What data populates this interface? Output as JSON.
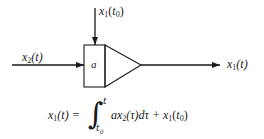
{
  "diagram": {
    "type": "integrator-block",
    "blocks": [
      {
        "id": "gain-box",
        "label": "a"
      },
      {
        "id": "integrator-triangle",
        "label": ""
      }
    ],
    "signals": {
      "input": {
        "var": "x",
        "sub": "2",
        "arg": "(t)"
      },
      "initial_condition": {
        "var": "x",
        "sub": "1",
        "arg_open": "(",
        "arg_var": "t",
        "arg_sub": "0",
        "arg_close": ")"
      },
      "output": {
        "var": "x",
        "sub": "1",
        "arg": "(t)"
      }
    },
    "equation": {
      "lhs_var": "x",
      "lhs_sub": "1",
      "lhs_arg": "(t) =",
      "integral_sign": "∫",
      "upper_limit": "t",
      "lower_limit_var": "t",
      "lower_limit_sub": "0",
      "integrand_a": "a",
      "integrand_x": "x",
      "integrand_sub": "2",
      "integrand_rest": "(τ)dτ + ",
      "ic_var": "x",
      "ic_sub": "1",
      "ic_open": "(",
      "ic_t": "t",
      "ic_t_sub": "0",
      "ic_close": ")"
    },
    "colors": {
      "stroke": "#1a1a1a",
      "background": "#ffffff"
    }
  }
}
